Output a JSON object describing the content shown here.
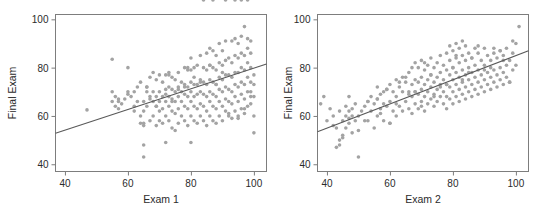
{
  "figure": {
    "background": "#ffffff",
    "point_color": "#a3a3a3",
    "line_color": "#595959",
    "axis_color": "#7d7d7d",
    "text_color": "#2b2b2b"
  },
  "chart_data": [
    {
      "type": "scatter",
      "title": "",
      "xlabel": "Exam 1",
      "ylabel": "Final Exam",
      "xlim": [
        37,
        104
      ],
      "ylim": [
        37,
        102
      ],
      "xticks": [
        40,
        60,
        80,
        100
      ],
      "yticks": [
        40,
        60,
        80,
        100
      ],
      "xticklabels": [
        "40",
        "60",
        "80",
        "100"
      ],
      "yticklabels": [
        "40",
        "60",
        "80",
        "100"
      ],
      "grid": false,
      "legend": "none",
      "fit_line": {
        "x": [
          37,
          104
        ],
        "y": [
          52.8,
          81.5
        ]
      },
      "x": [
        47,
        55,
        55,
        55,
        56,
        56,
        57,
        57,
        58,
        59,
        60,
        60,
        61,
        62,
        62,
        63,
        63,
        64,
        64,
        64,
        65,
        65,
        65,
        65,
        66,
        66,
        66,
        67,
        67,
        67,
        68,
        68,
        68,
        68,
        69,
        69,
        69,
        69,
        70,
        70,
        70,
        70,
        71,
        71,
        71,
        71,
        72,
        72,
        72,
        72,
        72,
        73,
        73,
        73,
        73,
        73,
        74,
        74,
        74,
        74,
        74,
        75,
        75,
        75,
        75,
        75,
        76,
        76,
        76,
        76,
        76,
        77,
        77,
        77,
        77,
        78,
        78,
        78,
        78,
        78,
        79,
        79,
        79,
        79,
        79,
        80,
        80,
        80,
        80,
        80,
        80,
        81,
        81,
        81,
        81,
        81,
        82,
        82,
        82,
        82,
        82,
        83,
        83,
        83,
        83,
        83,
        84,
        84,
        84,
        84,
        84,
        85,
        85,
        85,
        85,
        85,
        85,
        86,
        86,
        86,
        86,
        86,
        86,
        87,
        87,
        87,
        87,
        87,
        87,
        88,
        88,
        88,
        88,
        88,
        88,
        89,
        89,
        89,
        89,
        89,
        89,
        90,
        90,
        90,
        90,
        90,
        90,
        91,
        91,
        91,
        91,
        91,
        91,
        92,
        92,
        92,
        92,
        92,
        93,
        93,
        93,
        93,
        93,
        93,
        94,
        94,
        94,
        94,
        94,
        94,
        95,
        95,
        95,
        95,
        95,
        95,
        96,
        96,
        96,
        96,
        96,
        96,
        97,
        97,
        97,
        97,
        97,
        97,
        98,
        98,
        98,
        98,
        98,
        98,
        99,
        99,
        99,
        99,
        99,
        99,
        100,
        100,
        100,
        100,
        100,
        65,
        65,
        67,
        69,
        73,
        74,
        78,
        80,
        83,
        86,
        88,
        90,
        92,
        95,
        97,
        99,
        57,
        60,
        62,
        66,
        70,
        72,
        76,
        79,
        81,
        84,
        87,
        91,
        94,
        96,
        98
      ],
      "y": [
        62.5,
        83.5,
        70,
        66,
        68,
        64,
        66,
        63,
        65,
        67,
        80,
        69,
        68,
        70,
        62,
        72,
        66,
        60,
        57,
        74,
        43,
        48,
        56,
        66,
        64,
        70,
        72,
        58,
        68,
        76,
        60,
        66,
        70,
        78,
        56,
        64,
        68,
        75,
        58,
        62,
        70,
        77,
        57,
        63,
        68,
        74,
        49,
        60,
        66,
        71,
        77,
        58,
        64,
        68,
        72,
        78,
        55,
        62,
        67,
        71,
        76,
        54,
        61,
        66,
        70,
        75,
        57,
        63,
        68,
        72,
        78,
        60,
        66,
        70,
        74,
        58,
        64,
        69,
        73,
        80,
        56,
        63,
        68,
        72,
        79,
        49,
        60,
        66,
        70,
        74,
        84,
        58,
        64,
        68,
        73,
        80,
        57,
        63,
        69,
        73,
        81,
        60,
        65,
        70,
        75,
        85,
        58,
        64,
        69,
        74,
        80,
        56,
        62,
        68,
        73,
        79,
        86,
        60,
        66,
        70,
        75,
        81,
        88,
        58,
        64,
        69,
        74,
        80,
        87,
        57,
        63,
        68,
        73,
        79,
        85,
        60,
        66,
        71,
        76,
        82,
        90,
        58,
        64,
        70,
        75,
        81,
        87,
        62,
        67,
        72,
        77,
        83,
        91,
        60,
        66,
        71,
        77,
        84,
        59,
        65,
        70,
        76,
        82,
        91,
        62,
        68,
        73,
        78,
        85,
        92,
        60,
        66,
        72,
        78,
        84,
        90,
        63,
        69,
        74,
        80,
        86,
        93,
        61,
        67,
        73,
        79,
        85,
        97,
        64,
        70,
        76,
        82,
        88,
        92,
        68,
        74,
        80,
        86,
        91,
        70,
        73,
        60,
        77,
        68,
        53,
        62,
        57,
        67,
        64,
        77,
        66,
        72,
        79,
        74,
        81,
        73,
        78,
        61,
        59,
        63,
        65,
        67,
        70,
        64,
        72,
        66,
        69,
        71,
        80,
        76
      ]
    },
    {
      "type": "scatter",
      "title": "",
      "xlabel": "Exam 2",
      "ylabel": "Final Exam",
      "xlim": [
        37,
        104
      ],
      "ylim": [
        37,
        102
      ],
      "xticks": [
        40,
        60,
        80,
        100
      ],
      "yticks": [
        40,
        60,
        80,
        100
      ],
      "xticklabels": [
        "40",
        "60",
        "80",
        "100"
      ],
      "yticklabels": [
        "40",
        "60",
        "80",
        "100"
      ],
      "grid": false,
      "legend": "none",
      "fit_line": {
        "x": [
          37,
          104
        ],
        "y": [
          53.5,
          87.0
        ]
      },
      "x": [
        38,
        39,
        40,
        41,
        42,
        43,
        43,
        44,
        44,
        45,
        45,
        46,
        46,
        46,
        47,
        47,
        47,
        48,
        48,
        49,
        49,
        50,
        50,
        51,
        52,
        53,
        53,
        54,
        54,
        55,
        55,
        56,
        56,
        56,
        57,
        57,
        58,
        58,
        58,
        59,
        59,
        60,
        60,
        60,
        61,
        61,
        62,
        62,
        62,
        63,
        63,
        64,
        64,
        64,
        65,
        65,
        66,
        66,
        66,
        67,
        67,
        67,
        67,
        68,
        68,
        68,
        68,
        69,
        69,
        69,
        69,
        70,
        70,
        70,
        70,
        71,
        71,
        71,
        71,
        72,
        72,
        72,
        72,
        73,
        73,
        73,
        73,
        74,
        74,
        74,
        74,
        75,
        75,
        75,
        75,
        76,
        76,
        76,
        76,
        77,
        77,
        77,
        77,
        78,
        78,
        78,
        78,
        78,
        79,
        79,
        79,
        79,
        79,
        80,
        80,
        80,
        80,
        80,
        81,
        81,
        81,
        81,
        81,
        82,
        82,
        82,
        82,
        82,
        83,
        83,
        83,
        83,
        83,
        84,
        84,
        84,
        84,
        84,
        85,
        85,
        85,
        85,
        86,
        86,
        86,
        86,
        87,
        87,
        87,
        87,
        88,
        88,
        88,
        88,
        89,
        89,
        89,
        90,
        90,
        90,
        90,
        91,
        91,
        91,
        92,
        92,
        92,
        93,
        93,
        93,
        94,
        94,
        94,
        95,
        95,
        95,
        96,
        96,
        96,
        97,
        97,
        97,
        98,
        98,
        99,
        99,
        100,
        100,
        101,
        42,
        44,
        47,
        50,
        53,
        57,
        60,
        63,
        66,
        70,
        73,
        76,
        80,
        83,
        86,
        90,
        93,
        96,
        99,
        45,
        48,
        52,
        56,
        59,
        62,
        65,
        68,
        71,
        74,
        78,
        81,
        85,
        88,
        92,
        95,
        98
      ],
      "y": [
        65,
        68,
        58,
        63,
        60,
        47,
        55,
        48,
        62,
        52,
        58,
        55,
        60,
        64,
        57,
        62,
        68,
        53,
        60,
        58,
        65,
        43,
        60,
        62,
        64,
        58,
        66,
        62,
        68,
        55,
        65,
        60,
        67,
        72,
        63,
        69,
        58,
        65,
        70,
        64,
        71,
        57,
        66,
        73,
        62,
        70,
        60,
        68,
        75,
        64,
        72,
        62,
        70,
        76,
        66,
        74,
        63,
        70,
        78,
        61,
        68,
        73,
        80,
        65,
        70,
        75,
        82,
        63,
        69,
        74,
        80,
        66,
        71,
        76,
        83,
        62,
        68,
        73,
        79,
        65,
        70,
        75,
        81,
        67,
        72,
        77,
        84,
        64,
        69,
        74,
        80,
        66,
        71,
        76,
        82,
        68,
        73,
        78,
        85,
        65,
        70,
        75,
        81,
        63,
        68,
        73,
        79,
        86,
        67,
        72,
        77,
        83,
        89,
        65,
        70,
        75,
        80,
        87,
        68,
        73,
        78,
        84,
        90,
        66,
        71,
        76,
        82,
        88,
        69,
        74,
        79,
        85,
        91,
        67,
        72,
        77,
        83,
        89,
        70,
        75,
        80,
        86,
        68,
        73,
        78,
        84,
        71,
        76,
        81,
        88,
        69,
        74,
        79,
        86,
        72,
        77,
        83,
        70,
        75,
        81,
        88,
        73,
        78,
        85,
        71,
        76,
        83,
        74,
        79,
        86,
        72,
        77,
        84,
        75,
        80,
        87,
        73,
        78,
        85,
        76,
        81,
        88,
        74,
        83,
        79,
        86,
        81,
        90,
        97,
        56,
        50,
        59,
        54,
        66,
        61,
        57,
        74,
        69,
        64,
        77,
        72,
        80,
        75,
        84,
        79,
        88,
        83,
        91,
        51,
        63,
        58,
        67,
        71,
        65,
        76,
        70,
        82,
        68,
        73,
        85,
        78,
        89,
        80,
        87,
        74
      ]
    }
  ]
}
